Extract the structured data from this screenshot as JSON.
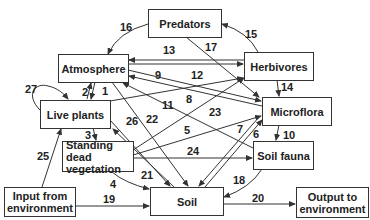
{
  "diagram": {
    "type": "flow diagram",
    "nodes": {
      "predators": "Predators",
      "atmosphere": "Atmosphere",
      "herbivores": "Herbivores",
      "microflora": "Microflora",
      "live_plants": "Live plants",
      "standing_dead": "Standing dead vegetation",
      "soil_fauna": "Soil fauna",
      "input": "Input from environment",
      "soil": "Soil",
      "output": "Output to environment"
    },
    "edges": [
      {
        "id": "1",
        "from": "Atmosphere",
        "to": "Live plants"
      },
      {
        "id": "2",
        "from": "Live plants",
        "to": "Atmosphere"
      },
      {
        "id": "3",
        "from": "Live plants",
        "to": "Standing dead vegetation"
      },
      {
        "id": "4",
        "from": "Standing dead vegetation",
        "to": "Soil"
      },
      {
        "id": "5",
        "from": "Standing dead vegetation",
        "to": "Microflora"
      },
      {
        "id": "6",
        "from": "Soil",
        "to": "Microflora"
      },
      {
        "id": "7",
        "from": "Microflora",
        "to": "Soil"
      },
      {
        "id": "8",
        "from": "Microflora",
        "to": "Atmosphere"
      },
      {
        "id": "9",
        "from": "Atmosphere",
        "to": "Microflora"
      },
      {
        "id": "10",
        "from": "Microflora",
        "to": "Soil fauna"
      },
      {
        "id": "11",
        "from": "Soil fauna",
        "to": "Atmosphere"
      },
      {
        "id": "12",
        "from": "Live plants",
        "to": "Herbivores"
      },
      {
        "id": "13",
        "from": "Herbivores",
        "to": "Atmosphere"
      },
      {
        "id": "14",
        "from": "Herbivores",
        "to": "Microflora"
      },
      {
        "id": "15",
        "from": "Herbivores",
        "to": "Predators"
      },
      {
        "id": "16",
        "from": "Predators",
        "to": "Atmosphere"
      },
      {
        "id": "17",
        "from": "Predators",
        "to": "Microflora"
      },
      {
        "id": "18",
        "from": "Soil fauna",
        "to": "Soil"
      },
      {
        "id": "19",
        "from": "Input from environment",
        "to": "Soil"
      },
      {
        "id": "20",
        "from": "Soil",
        "to": "Output to environment"
      },
      {
        "id": "21",
        "from": "Live plants",
        "to": "Soil"
      },
      {
        "id": "22",
        "from": "Atmosphere",
        "to": "Soil"
      },
      {
        "id": "23",
        "from": "Standing dead vegetation",
        "to": "Herbivores"
      },
      {
        "id": "24",
        "from": "Standing dead vegetation",
        "to": "Soil fauna"
      },
      {
        "id": "25",
        "from": "Input from environment",
        "to": "Live plants"
      },
      {
        "id": "26",
        "from": "Soil",
        "to": "Live plants"
      },
      {
        "id": "27",
        "from": "Live plants",
        "to": "Live plants"
      }
    ],
    "labels": [
      "1",
      "2",
      "3",
      "4",
      "5",
      "6",
      "7",
      "8",
      "9",
      "10",
      "11",
      "12",
      "13",
      "14",
      "15",
      "16",
      "17",
      "18",
      "19",
      "20",
      "21",
      "22",
      "23",
      "24",
      "25",
      "26",
      "27"
    ]
  }
}
